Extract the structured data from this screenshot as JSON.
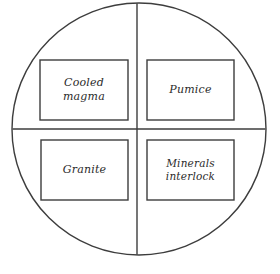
{
  "diagram": {
    "type": "circle-quadrant-concept-map",
    "canvas": {
      "width": 280,
      "height": 274,
      "background": "#ffffff"
    },
    "stroke_color": "#3d3d3d",
    "text_color": "#2b2b2b",
    "circle": {
      "name": "outer-circle",
      "center_x": 139,
      "center_y": 129,
      "radius_x": 127,
      "radius_y": 126
    },
    "divider_vertical": {
      "x": 137,
      "y1": 3,
      "y2": 255
    },
    "divider_horizontal": {
      "y": 129,
      "x1": 12,
      "x2": 266
    },
    "quadrants": [
      {
        "id": "top-left",
        "label": "Cooled magma",
        "box": {
          "x": 40,
          "y": 60,
          "width": 88,
          "height": 60
        }
      },
      {
        "id": "top-right",
        "label": "Pumice",
        "box": {
          "x": 147,
          "y": 60,
          "width": 87,
          "height": 60
        }
      },
      {
        "id": "bottom-left",
        "label": "Granite",
        "box": {
          "x": 41,
          "y": 140,
          "width": 87,
          "height": 60
        }
      },
      {
        "id": "bottom-right",
        "label": "Minerals\ninterlock",
        "box": {
          "x": 147,
          "y": 140,
          "width": 87,
          "height": 60
        }
      }
    ]
  }
}
